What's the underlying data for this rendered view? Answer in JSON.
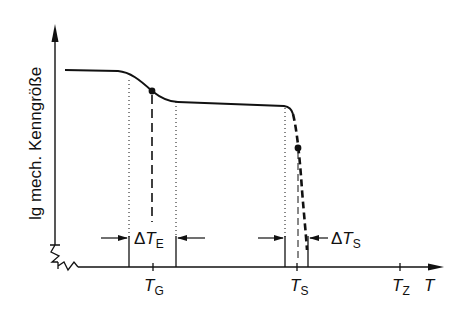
{
  "diagram": {
    "y_axis_label": "lg mech. Kenngröße",
    "x_axis_label": "T",
    "ticks": {
      "TG": {
        "main": "T",
        "sub": "G"
      },
      "TS": {
        "main": "T",
        "sub": "S"
      },
      "TZ": {
        "main": "T",
        "sub": "Z"
      }
    },
    "intervals": {
      "dTE": {
        "delta": "Δ",
        "main": "T",
        "sub": "E"
      },
      "dTS": {
        "delta": "Δ",
        "main": "T",
        "sub": "S"
      }
    }
  }
}
